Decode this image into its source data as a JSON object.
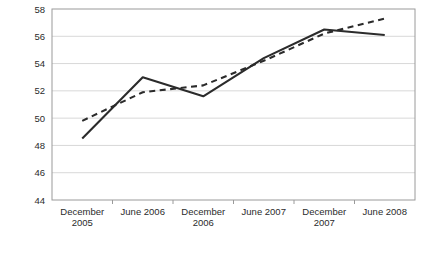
{
  "chart_data": {
    "type": "line",
    "title": "",
    "subtitle": "",
    "xlabel": "",
    "ylabel": "",
    "categories": [
      "December 2005",
      "June 2006",
      "December 2006",
      "June 2007",
      "December 2007",
      "June 2008"
    ],
    "ylim": [
      44,
      58
    ],
    "yticks": [
      44,
      46,
      48,
      50,
      52,
      54,
      56,
      58
    ],
    "ytick_labels": [
      "44",
      "46",
      "48",
      "50",
      "52",
      "54",
      "56",
      "58"
    ],
    "grid": true,
    "grid_axis": "y",
    "legend": "none",
    "series": [
      {
        "name": "solid-series",
        "style": "solid",
        "color": "#2b2b2b",
        "values": [
          48.5,
          53.0,
          51.6,
          54.4,
          56.5,
          56.1
        ]
      },
      {
        "name": "dashed-series",
        "style": "dashed",
        "color": "#2b2b2b",
        "values": [
          49.8,
          51.9,
          52.4,
          54.2,
          56.2,
          57.3
        ]
      }
    ],
    "axis_color": "#9a9a9a",
    "grid_color": "#d8d8d8",
    "plot_bg": "#ffffff"
  }
}
